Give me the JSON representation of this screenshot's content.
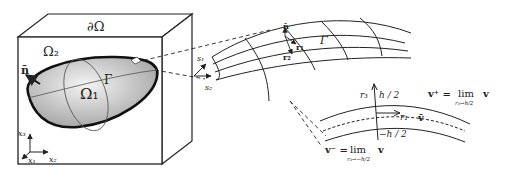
{
  "box": {
    "boundary_label": "∂Ω",
    "outer_domain_label": "Ω₂",
    "inner_domain_label": "Ω₁",
    "interface_label": "Γ",
    "normal_label": "n̄",
    "axes": {
      "x1": "x₁",
      "x2": "x₂",
      "x3": "x₃"
    }
  },
  "surface_patch": {
    "interface_label": "Γ",
    "normal_label": "n̄",
    "tangent_r1": "r₁",
    "tangent_r2": "r₂",
    "s1": "s₁",
    "s2": "s₂"
  },
  "shell_section": {
    "r3": "r₃",
    "r1": "r₁",
    "h_plus": "h / 2",
    "h_minus": "−h / 2",
    "v_bar": "v̄",
    "v_plus_lhs": "v⁺ =",
    "v_plus_lim": "lim",
    "v_plus_sub": "r₃→h/2",
    "v_plus_rhs": "v",
    "v_minus_lhs": "v⁻ =",
    "v_minus_lim": "lim",
    "v_minus_sub": "r₃→−h/2",
    "v_minus_rhs": "v"
  }
}
